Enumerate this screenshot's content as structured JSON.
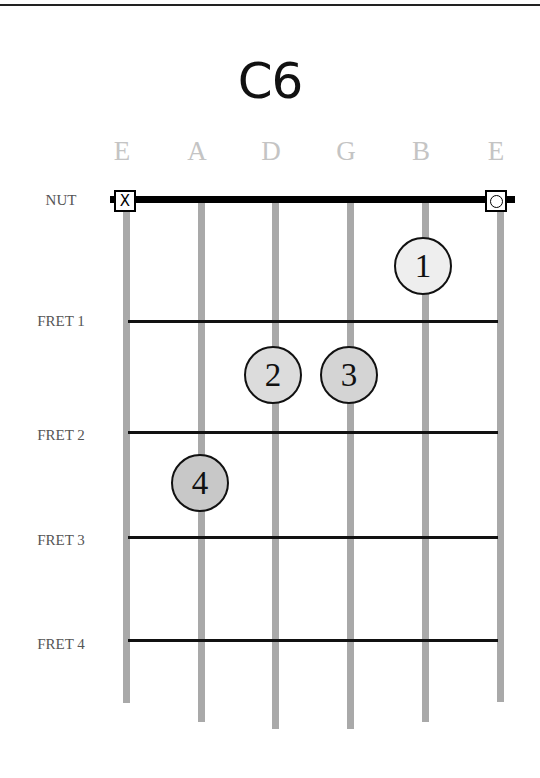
{
  "chord": {
    "name": "C6"
  },
  "strings": [
    {
      "label": "E",
      "x": 126,
      "bottom": 703
    },
    {
      "label": "A",
      "x": 201,
      "bottom": 722
    },
    {
      "label": "D",
      "x": 275,
      "bottom": 729
    },
    {
      "label": "G",
      "x": 350,
      "bottom": 729
    },
    {
      "label": "B",
      "x": 425,
      "bottom": 722
    },
    {
      "label": "E",
      "x": 500,
      "bottom": 702
    }
  ],
  "rows": [
    {
      "label": "NUT",
      "y": 200
    },
    {
      "label": "FRET 1",
      "y": 321
    },
    {
      "label": "FRET 2",
      "y": 432
    },
    {
      "label": "FRET 3",
      "y": 537
    },
    {
      "label": "FRET 4",
      "y": 640
    }
  ],
  "open_markers": [
    {
      "string": "E (6th)",
      "symbol": "X",
      "meaning": "muted"
    },
    {
      "string": "E (1st)",
      "symbol": "O",
      "meaning": "open"
    }
  ],
  "fingers": [
    {
      "number": "1",
      "string": "B",
      "fret": 1,
      "x": 423,
      "y": 266,
      "fill": "#eeeeee"
    },
    {
      "number": "2",
      "string": "D",
      "fret": 2,
      "x": 273,
      "y": 375,
      "fill": "#dcdcdc"
    },
    {
      "number": "3",
      "string": "G",
      "fret": 2,
      "x": 349,
      "y": 375,
      "fill": "#d4d4d4"
    },
    {
      "number": "4",
      "string": "A",
      "fret": 3,
      "x": 200,
      "y": 483,
      "fill": "#c8c8c8"
    }
  ]
}
